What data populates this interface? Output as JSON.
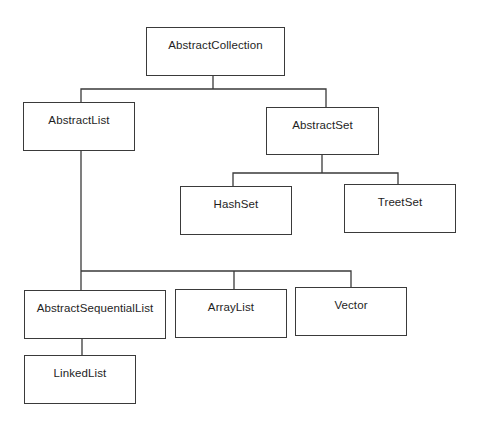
{
  "diagram": {
    "title": "",
    "nodes": [
      {
        "id": "abstract-collection",
        "label": "AbstractCollection",
        "parent": null
      },
      {
        "id": "abstract-list",
        "label": "AbstractList",
        "parent": "abstract-collection"
      },
      {
        "id": "abstract-set",
        "label": "AbstractSet",
        "parent": "abstract-collection"
      },
      {
        "id": "hash-set",
        "label": "HashSet",
        "parent": "abstract-set"
      },
      {
        "id": "treet-set",
        "label": "TreetSet",
        "parent": "abstract-set"
      },
      {
        "id": "abstract-sequential-list",
        "label": "AbstractSequentialList",
        "parent": "abstract-list"
      },
      {
        "id": "array-list",
        "label": "ArrayList",
        "parent": "abstract-list"
      },
      {
        "id": "vector",
        "label": "Vector",
        "parent": "abstract-list"
      },
      {
        "id": "linked-list",
        "label": "LinkedList",
        "parent": "abstract-sequential-list"
      }
    ],
    "line_color": "#3a3a3a",
    "box_border_color": "#3a3a3a",
    "text_color": "#1e1e1e"
  }
}
